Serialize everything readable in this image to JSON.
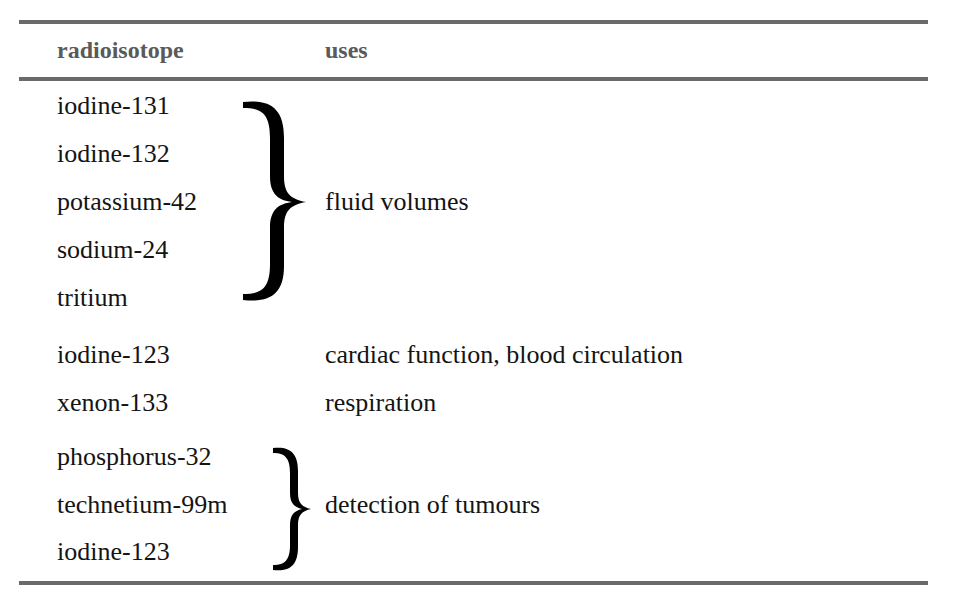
{
  "table": {
    "headers": {
      "isotope": "radioisotope",
      "uses": "uses"
    },
    "groups": [
      {
        "isotopes": [
          "iodine-131",
          "iodine-132",
          "potassium-42",
          "sodium-24",
          "tritium"
        ],
        "use": "fluid volumes",
        "bracketed": true
      },
      {
        "isotopes": [
          "iodine-123"
        ],
        "use": "cardiac function, blood circulation",
        "bracketed": false
      },
      {
        "isotopes": [
          "xenon-133"
        ],
        "use": "respiration",
        "bracketed": false
      },
      {
        "isotopes": [
          "phosphorus-32",
          "technetium-99m",
          "iodine-123"
        ],
        "use": "detection of tumours",
        "bracketed": true
      }
    ]
  },
  "icons": {
    "large_brace": "right-curly-brace",
    "small_brace": "right-curly-brace"
  },
  "colors": {
    "rule": "#6a6a6a",
    "header_text": "#5a5a5a",
    "body_text": "#141414"
  }
}
